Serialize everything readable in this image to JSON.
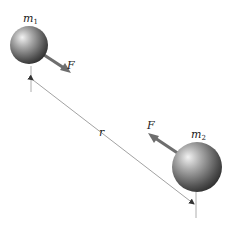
{
  "diagram": {
    "mass1": {
      "label": "m",
      "subscript": "1",
      "cx": 29,
      "cy": 45,
      "r": 19
    },
    "mass2": {
      "label": "m",
      "subscript": "2",
      "cx": 197,
      "cy": 167,
      "r": 25
    },
    "force1": {
      "label": "F"
    },
    "force2": {
      "label": "F"
    },
    "distance": {
      "label": "r"
    },
    "colors": {
      "sphere_light": "#e8e8e8",
      "sphere_mid": "#8a8a8a",
      "sphere_dark": "#2e2e2e",
      "arrow": "#6e6e6e",
      "dimension_line": "#8a8a8a",
      "text": "#222222"
    }
  }
}
